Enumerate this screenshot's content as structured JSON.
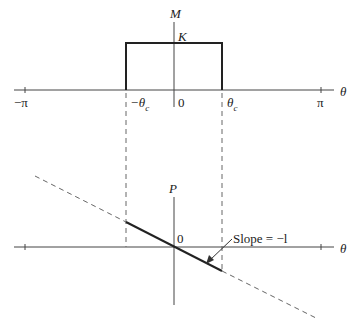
{
  "diagram": {
    "top_plot": {
      "y_axis_label": "M",
      "x_axis_label": "θ",
      "amplitude_label": "K",
      "tick_labels": {
        "neg_pi": "−π",
        "neg_theta_c": "−θ",
        "zero": "0",
        "theta_c": "θ",
        "pi": "π",
        "sub_c": "c"
      }
    },
    "bottom_plot": {
      "y_axis_label": "P",
      "x_axis_label": "θ",
      "origin_label": "0",
      "annotation": "Slope = −l"
    }
  }
}
